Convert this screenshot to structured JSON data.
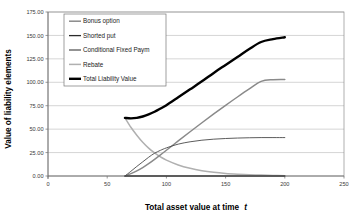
{
  "chart_data": {
    "type": "line",
    "title": "",
    "xlabel": "Total asset value at time t",
    "xlabel_plain": "Total asset value at time",
    "xlabel_italic": "t",
    "ylabel": "Value of liability elements",
    "xlim": [
      0,
      250
    ],
    "ylim": [
      0,
      175
    ],
    "xticks": [
      0,
      50,
      100,
      150,
      200,
      250
    ],
    "xtick_labels": [
      "0",
      "50",
      "100",
      "150",
      "200",
      "250"
    ],
    "yticks": [
      0,
      25,
      50,
      75,
      100,
      125,
      150,
      175
    ],
    "ytick_labels": [
      "0.00",
      "25.00",
      "50.00",
      "75.00",
      "100.00",
      "125.00",
      "150.00",
      "175.00"
    ],
    "grid": "horizontal",
    "legend_position": "upper-left-inside",
    "series": [
      {
        "name": "Bonus option",
        "color": "#8a8a8a",
        "width": 1.5,
        "x": [
          65,
          70,
          75,
          80,
          85,
          90,
          95,
          100,
          110,
          120,
          130,
          140,
          150,
          160,
          170,
          180,
          190,
          200
        ],
        "values": [
          0.0,
          2.5,
          5.4,
          9.0,
          13.2,
          17.8,
          22.6,
          27.5,
          37.4,
          47.2,
          56.8,
          66.2,
          75.4,
          84.3,
          92.9,
          101.0,
          102.8,
          103.0
        ]
      },
      {
        "name": "Shorted put",
        "color": "#2b2b2b",
        "width": 1.3,
        "x": [
          65,
          80,
          100,
          120,
          140,
          160,
          180,
          200
        ],
        "values": [
          0.0,
          0.0,
          0.0,
          0.0,
          0.0,
          0.0,
          0.0,
          0.0
        ]
      },
      {
        "name": "Conditional Fixed Paym",
        "color": "#4a4a4a",
        "width": 0.9,
        "x": [
          65,
          70,
          75,
          80,
          85,
          90,
          95,
          100,
          110,
          120,
          130,
          140,
          150,
          160,
          170,
          180,
          190,
          200
        ],
        "values": [
          0.0,
          5.0,
          10.2,
          15.1,
          20.0,
          24.3,
          27.4,
          30.0,
          34.0,
          36.5,
          38.2,
          39.3,
          40.0,
          40.5,
          40.8,
          41.0,
          41.0,
          41.0
        ]
      },
      {
        "name": "Rebate",
        "color": "#b0b0b0",
        "width": 1.5,
        "x": [
          65,
          70,
          75,
          80,
          85,
          90,
          95,
          100,
          110,
          120,
          130,
          140,
          150,
          160,
          170,
          180,
          190,
          200
        ],
        "values": [
          62.0,
          52.0,
          43.5,
          36.0,
          29.8,
          24.6,
          20.4,
          17.0,
          11.8,
          8.2,
          5.7,
          4.0,
          2.8,
          2.0,
          1.4,
          1.0,
          0.6,
          0.3
        ]
      },
      {
        "name": "Total Liability Value",
        "color": "#000000",
        "width": 2.4,
        "x": [
          65,
          70,
          75,
          80,
          85,
          90,
          95,
          100,
          110,
          120,
          130,
          140,
          150,
          160,
          170,
          180,
          190,
          200
        ],
        "values": [
          62.0,
          61.5,
          62.0,
          63.5,
          65.8,
          68.6,
          72.0,
          75.6,
          84.0,
          92.5,
          101.0,
          110.0,
          118.5,
          127.0,
          135.5,
          143.0,
          146.0,
          148.0
        ]
      }
    ]
  },
  "legend": {
    "items": [
      {
        "label": "Bonus option"
      },
      {
        "label": "Shorted put"
      },
      {
        "label": "Conditional Fixed Paym"
      },
      {
        "label": "Rebate"
      },
      {
        "label": "Total Liability Value"
      }
    ]
  }
}
